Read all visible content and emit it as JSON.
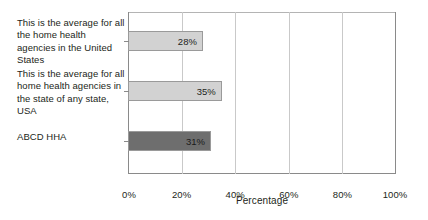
{
  "chart_data": {
    "type": "bar",
    "orientation": "horizontal",
    "title": "",
    "xlabel": "Percentage",
    "ylabel": "",
    "xlim": [
      0,
      100
    ],
    "xticks": [
      0,
      20,
      40,
      60,
      80,
      100
    ],
    "xtick_labels": [
      "0%",
      "20%",
      "40%",
      "60%",
      "80%",
      "100%"
    ],
    "grid": true,
    "legend": "none",
    "categories": [
      "This is the average for all the home health agencies in the United States",
      "This is the average for all home health agencies in the state of any state, USA",
      "ABCD HHA"
    ],
    "values": [
      28,
      35,
      31
    ],
    "value_labels": [
      "28%",
      "35%",
      "31%"
    ],
    "bar_colors": [
      "#d2d2d2",
      "#d2d2d2",
      "#6e6e6e"
    ],
    "bar_border_color": "#9a9a9a",
    "axis_color": "#8a8a8a",
    "gridline_color": "#c9c9c9",
    "background_color": "#ffffff",
    "text_color": "#231f20"
  }
}
